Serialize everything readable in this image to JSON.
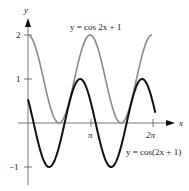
{
  "chart_data": {
    "type": "line",
    "title": "",
    "xlabel": "x",
    "ylabel": "y",
    "xlim": [
      0,
      6.6
    ],
    "ylim": [
      -1.2,
      2.2
    ],
    "x_ticks": [
      "π",
      "2π"
    ],
    "y_ticks": [
      "2",
      "1",
      "−1"
    ],
    "grid": false,
    "series": [
      {
        "name": "y = cos 2x + 1",
        "color": "#8a8a8a",
        "formula": "cos(2x)+1",
        "x_range": [
          0,
          6.283
        ]
      },
      {
        "name": "y = cos(2x + 1)",
        "color": "#111111",
        "formula": "cos(2x+1)",
        "x_range": [
          0,
          6.45
        ]
      }
    ],
    "annotations": [
      {
        "text": "y = cos 2x + 1",
        "near": "top-center"
      },
      {
        "text": "y = cos(2x + 1)",
        "near": "bottom-right"
      }
    ]
  },
  "labels": {
    "x_axis": "x",
    "y_axis": "y",
    "tick_pi": "π",
    "tick_2pi": "2π",
    "tick_y2": "2",
    "tick_y1": "1",
    "tick_ym1": "−1",
    "gray_label": "y = cos 2x + 1",
    "black_label": "y = cos(2x + 1)"
  }
}
